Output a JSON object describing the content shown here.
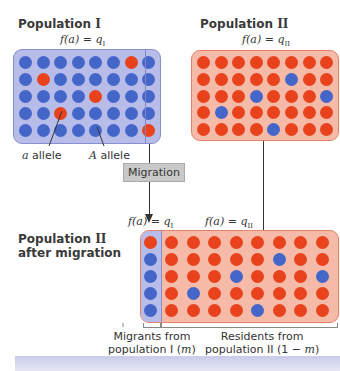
{
  "population_1": {
    "title": "Population ",
    "roman": "I",
    "equation": {
      "prefix": "f(a) = q",
      "sub": "I"
    },
    "grid": [
      [
        "A",
        "A",
        "A",
        "A",
        "A",
        "A",
        "a",
        "A"
      ],
      [
        "A",
        "a",
        "A",
        "A",
        "A",
        "A",
        "A",
        "A"
      ],
      [
        "A",
        "A",
        "A",
        "A",
        "a",
        "A",
        "A",
        "A"
      ],
      [
        "A",
        "A",
        "a",
        "A",
        "A",
        "A",
        "A",
        "A"
      ],
      [
        "A",
        "A",
        "A",
        "A",
        "A",
        "A",
        "A",
        "a"
      ]
    ],
    "labels": {
      "a_allele": "allele",
      "a_letter": "a",
      "A_allele": "allele",
      "A_letter": "A"
    }
  },
  "population_2": {
    "title": "Population ",
    "roman": "II",
    "equation": {
      "prefix": "f(a) = q",
      "sub": "II"
    },
    "grid": [
      [
        "a",
        "a",
        "a",
        "a",
        "a",
        "a",
        "a",
        "a"
      ],
      [
        "a",
        "a",
        "a",
        "a",
        "a",
        "A",
        "a",
        "a"
      ],
      [
        "a",
        "a",
        "a",
        "A",
        "a",
        "a",
        "a",
        "A"
      ],
      [
        "a",
        "A",
        "a",
        "a",
        "a",
        "a",
        "a",
        "a"
      ],
      [
        "a",
        "a",
        "a",
        "a",
        "A",
        "a",
        "a",
        "a"
      ]
    ]
  },
  "migration": {
    "label": "Migration"
  },
  "after_migration": {
    "title_line1": "Population ",
    "roman": "II",
    "title_line2": "after migration",
    "eq_migrants": {
      "prefix": "f(a) = q",
      "sub": "I"
    },
    "eq_residents": {
      "prefix": "f(a) = q",
      "sub": "II"
    },
    "migrants": [
      "a",
      "A",
      "A",
      "A",
      "A"
    ],
    "residents": [
      [
        "a",
        "a",
        "a",
        "a",
        "a",
        "a",
        "a",
        "a"
      ],
      [
        "a",
        "a",
        "a",
        "a",
        "a",
        "A",
        "a",
        "a"
      ],
      [
        "a",
        "a",
        "a",
        "A",
        "a",
        "a",
        "a",
        "A"
      ],
      [
        "a",
        "A",
        "a",
        "a",
        "a",
        "a",
        "a",
        "a"
      ],
      [
        "a",
        "a",
        "a",
        "a",
        "A",
        "a",
        "a",
        "a"
      ]
    ],
    "caption_migrants": {
      "line1": "Migrants from",
      "line2": "population I (",
      "var": "m",
      "end": ")"
    },
    "caption_residents": {
      "line1": "Residents from",
      "line2": "population II (1 − ",
      "var": "m",
      "end": ")"
    }
  },
  "colors": {
    "A_allele_dot": "#4566c9",
    "a_allele_dot": "#e8431d",
    "pop1_background": "#b8bce9",
    "pop2_background": "#f6bba8"
  }
}
